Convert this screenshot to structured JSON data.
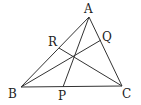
{
  "diagram": {
    "type": "triangle-with-cevians",
    "points": {
      "A": {
        "label": "A",
        "x": 89,
        "y": 17
      },
      "B": {
        "label": "B",
        "x": 21,
        "y": 87
      },
      "C": {
        "label": "C",
        "x": 122,
        "y": 86
      },
      "P": {
        "label": "P",
        "x": 63,
        "y": 87
      },
      "Q": {
        "label": "Q",
        "x": 101,
        "y": 40
      },
      "R": {
        "label": "R",
        "x": 59,
        "y": 48
      },
      "O": {
        "label": "",
        "x": 74,
        "y": 56
      }
    },
    "segments": [
      [
        "A",
        "B"
      ],
      [
        "B",
        "C"
      ],
      [
        "C",
        "A"
      ],
      [
        "A",
        "P"
      ],
      [
        "B",
        "Q"
      ],
      [
        "C",
        "R"
      ]
    ],
    "labels": {
      "A": "A",
      "B": "B",
      "C": "C",
      "P": "P",
      "Q": "Q",
      "R": "R"
    }
  }
}
